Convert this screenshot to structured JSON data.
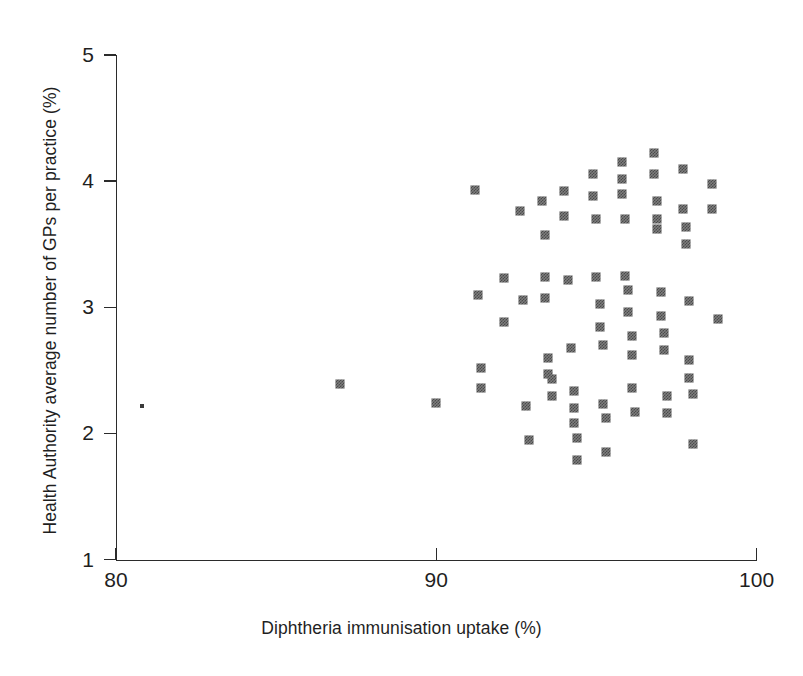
{
  "chart_data": {
    "type": "scatter",
    "title": "",
    "xlabel": "Diphtheria immunisation uptake (%)",
    "ylabel": "Health Authority average number of GPs per practice (%)",
    "xlim": [
      80,
      100
    ],
    "ylim": [
      1,
      5
    ],
    "xticks": [
      80,
      90,
      100
    ],
    "yticks": [
      1,
      2,
      3,
      4,
      5
    ],
    "xtick_labels": [
      "80",
      "90",
      "100"
    ],
    "ytick_labels": [
      "1",
      "2",
      "3",
      "4",
      "5"
    ],
    "grid": false,
    "legend": null,
    "marker": "filled-square",
    "marker_color": "#6e6e6e",
    "axis_color": "#2b2b2b",
    "points": [
      {
        "x": 80.8,
        "y": 2.22,
        "size": "tiny"
      },
      {
        "x": 87.0,
        "y": 2.39
      },
      {
        "x": 90.0,
        "y": 2.24
      },
      {
        "x": 91.2,
        "y": 3.93
      },
      {
        "x": 91.3,
        "y": 3.1
      },
      {
        "x": 91.4,
        "y": 2.52
      },
      {
        "x": 91.4,
        "y": 2.36
      },
      {
        "x": 92.1,
        "y": 3.23
      },
      {
        "x": 92.1,
        "y": 2.88
      },
      {
        "x": 92.6,
        "y": 3.76
      },
      {
        "x": 92.7,
        "y": 3.06
      },
      {
        "x": 92.8,
        "y": 2.22
      },
      {
        "x": 92.9,
        "y": 1.95
      },
      {
        "x": 93.3,
        "y": 3.84
      },
      {
        "x": 93.4,
        "y": 3.57
      },
      {
        "x": 93.4,
        "y": 3.24
      },
      {
        "x": 93.4,
        "y": 3.07
      },
      {
        "x": 93.5,
        "y": 2.6
      },
      {
        "x": 93.5,
        "y": 2.47
      },
      {
        "x": 93.6,
        "y": 2.43
      },
      {
        "x": 93.6,
        "y": 2.3
      },
      {
        "x": 94.0,
        "y": 3.92
      },
      {
        "x": 94.0,
        "y": 3.72
      },
      {
        "x": 94.1,
        "y": 3.22
      },
      {
        "x": 94.2,
        "y": 2.68
      },
      {
        "x": 94.3,
        "y": 2.34
      },
      {
        "x": 94.3,
        "y": 2.2
      },
      {
        "x": 94.3,
        "y": 2.08
      },
      {
        "x": 94.4,
        "y": 1.96
      },
      {
        "x": 94.4,
        "y": 1.79
      },
      {
        "x": 94.9,
        "y": 4.06
      },
      {
        "x": 94.9,
        "y": 3.88
      },
      {
        "x": 95.0,
        "y": 3.7
      },
      {
        "x": 95.0,
        "y": 3.24
      },
      {
        "x": 95.1,
        "y": 3.03
      },
      {
        "x": 95.1,
        "y": 2.84
      },
      {
        "x": 95.2,
        "y": 2.7
      },
      {
        "x": 95.2,
        "y": 2.23
      },
      {
        "x": 95.3,
        "y": 2.12
      },
      {
        "x": 95.3,
        "y": 1.85
      },
      {
        "x": 95.8,
        "y": 4.15
      },
      {
        "x": 95.8,
        "y": 4.02
      },
      {
        "x": 95.8,
        "y": 3.9
      },
      {
        "x": 95.9,
        "y": 3.7
      },
      {
        "x": 95.9,
        "y": 3.25
      },
      {
        "x": 96.0,
        "y": 3.14
      },
      {
        "x": 96.0,
        "y": 2.96
      },
      {
        "x": 96.1,
        "y": 2.77
      },
      {
        "x": 96.1,
        "y": 2.62
      },
      {
        "x": 96.1,
        "y": 2.36
      },
      {
        "x": 96.2,
        "y": 2.17
      },
      {
        "x": 96.8,
        "y": 4.22
      },
      {
        "x": 96.8,
        "y": 4.06
      },
      {
        "x": 96.9,
        "y": 3.84
      },
      {
        "x": 96.9,
        "y": 3.7
      },
      {
        "x": 96.9,
        "y": 3.62
      },
      {
        "x": 97.0,
        "y": 3.12
      },
      {
        "x": 97.0,
        "y": 2.93
      },
      {
        "x": 97.1,
        "y": 2.8
      },
      {
        "x": 97.1,
        "y": 2.66
      },
      {
        "x": 97.2,
        "y": 2.3
      },
      {
        "x": 97.2,
        "y": 2.16
      },
      {
        "x": 97.7,
        "y": 4.1
      },
      {
        "x": 97.7,
        "y": 3.78
      },
      {
        "x": 97.8,
        "y": 3.64
      },
      {
        "x": 97.8,
        "y": 3.5
      },
      {
        "x": 97.9,
        "y": 3.05
      },
      {
        "x": 97.9,
        "y": 2.58
      },
      {
        "x": 97.9,
        "y": 2.44
      },
      {
        "x": 98.0,
        "y": 2.31
      },
      {
        "x": 98.0,
        "y": 1.92
      },
      {
        "x": 98.6,
        "y": 3.98
      },
      {
        "x": 98.6,
        "y": 3.78
      },
      {
        "x": 98.8,
        "y": 2.91
      }
    ]
  }
}
